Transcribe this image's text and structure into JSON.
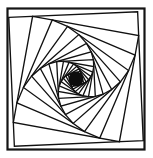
{
  "figure": {
    "title": "Whirling squares spiral",
    "type": "geometric-line-figure",
    "background_color": "#ffffff",
    "stroke_color": "#111111",
    "canvas": {
      "width": 153,
      "height": 158
    }
  },
  "frame": {
    "name": "outer-border-rectangle",
    "x": 7.5,
    "y": 8.5,
    "width": 137,
    "height": 141,
    "stroke_color": "#141414",
    "stroke_width": 2.2,
    "fill": "#ffffff"
  },
  "chart_data": {
    "type": "line",
    "title": "Whirling squares spiral",
    "xlabel": "",
    "ylabel": "",
    "grid": false,
    "legend": null,
    "xlim": [
      0,
      153
    ],
    "ylim": [
      0,
      158
    ],
    "spiral": {
      "start_square": {
        "cx": 76.0,
        "cy": 79.0,
        "half_size": 64.5,
        "rotation_deg": -2.5
      },
      "center": {
        "x": 76.0,
        "y": 79.0
      },
      "edge_fraction": 0.185,
      "iterations": 46,
      "shrink_ratio": 0.8272,
      "turn_per_step_deg": 10.5,
      "core": {
        "name": "dark-core",
        "cx": 76.0,
        "cy": 79.0,
        "radius": 7.4,
        "color": "#0d0d0d"
      },
      "stroke_width_outer": 1.35,
      "stroke_width_inner": 1.15
    }
  }
}
